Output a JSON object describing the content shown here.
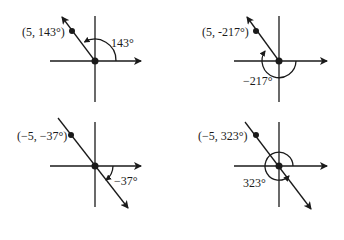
{
  "panels": [
    {
      "point_label": "(5, 143°)",
      "angle_label": "143°",
      "r": 5,
      "theta": 143
    },
    {
      "point_label": "(5, -217°)",
      "angle_label": "−217°",
      "r": 5,
      "theta": -217
    },
    {
      "point_label": "(−5, −37°)",
      "angle_label": "−37°",
      "r": -5,
      "theta": -37
    },
    {
      "point_label": "(−5, 323°)",
      "angle_label": "323°",
      "r": -5,
      "theta": 323
    }
  ]
}
